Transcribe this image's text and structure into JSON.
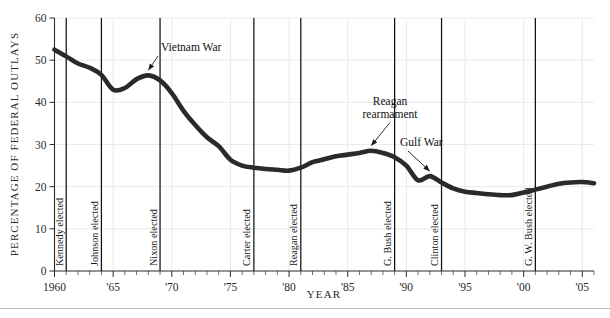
{
  "figure": {
    "top_caption_fragment": "",
    "bottom_rule": true
  },
  "chart_data": {
    "type": "line",
    "title": "",
    "xlabel": "YEAR",
    "ylabel": "PERCENTAGE OF FEDERAL OUTLAYS",
    "xlim": [
      1960,
      2006
    ],
    "ylim": [
      0,
      60
    ],
    "grid": true,
    "legend_position": "none",
    "y_ticks": [
      0,
      10,
      20,
      30,
      40,
      50,
      60
    ],
    "y_tick_labels": [
      "0",
      "10",
      "20",
      "30",
      "40",
      "50",
      "60"
    ],
    "x_ticks": [
      1960,
      1965,
      1970,
      1975,
      1980,
      1985,
      1990,
      1995,
      2000,
      2005
    ],
    "x_tick_labels": [
      "1960",
      "'65",
      "'70",
      "'75",
      "'80",
      "'85",
      "'90",
      "'95",
      "'00",
      "'05"
    ],
    "x_minor_tick_interval": 1,
    "series": [
      {
        "name": "Defense share of federal outlays",
        "x": [
          1960,
          1961,
          1962,
          1963,
          1964,
          1965,
          1966,
          1967,
          1968,
          1969,
          1970,
          1971,
          1972,
          1973,
          1974,
          1975,
          1976,
          1977,
          1978,
          1979,
          1980,
          1981,
          1982,
          1983,
          1984,
          1985,
          1986,
          1987,
          1988,
          1989,
          1990,
          1991,
          1992,
          1993,
          1994,
          1995,
          1996,
          1997,
          1998,
          1999,
          2000,
          2001,
          2002,
          2003,
          2004,
          2005,
          2006
        ],
        "values": [
          52.5,
          50.9,
          49.2,
          48.2,
          46.5,
          43.0,
          43.4,
          45.5,
          46.4,
          45.2,
          42.2,
          38.0,
          34.6,
          31.7,
          29.6,
          26.4,
          25.0,
          24.5,
          24.2,
          24.0,
          23.8,
          24.5,
          25.8,
          26.5,
          27.2,
          27.6,
          28.0,
          28.5,
          28.0,
          27.0,
          25.0,
          21.5,
          22.5,
          21.0,
          19.6,
          18.8,
          18.5,
          18.2,
          18.0,
          18.0,
          18.6,
          19.3,
          20.0,
          20.7,
          21.0,
          21.1,
          20.8
        ]
      }
    ],
    "event_lines": [
      {
        "label": "Kennedy elected",
        "year": 1961
      },
      {
        "label": "Johnson elected",
        "year": 1964
      },
      {
        "label": "Nixon elected",
        "year": 1969
      },
      {
        "label": "Carter elected",
        "year": 1977
      },
      {
        "label": "Reagan elected",
        "year": 1981
      },
      {
        "label": "G. Bush elected",
        "year": 1989
      },
      {
        "label": "Clinton elected",
        "year": 1993
      },
      {
        "label": "G. W. Bush elected",
        "year": 2001
      }
    ],
    "annotations": [
      {
        "label": "Vietnam War",
        "line2": "",
        "point_year": 1968,
        "point_value": 46.4
      },
      {
        "label": "Reagan",
        "line2": "rearmament",
        "point_year": 1987,
        "point_value": 28.5
      },
      {
        "label": "Gulf War",
        "line2": "",
        "point_year": 1992,
        "point_value": 22.5
      }
    ]
  },
  "colors": {
    "data_line": "#2a2a2a",
    "event_line": "#111111",
    "gridline": "#e9e9ef",
    "axis": "#2b2b2b",
    "background": "#ffffff"
  }
}
